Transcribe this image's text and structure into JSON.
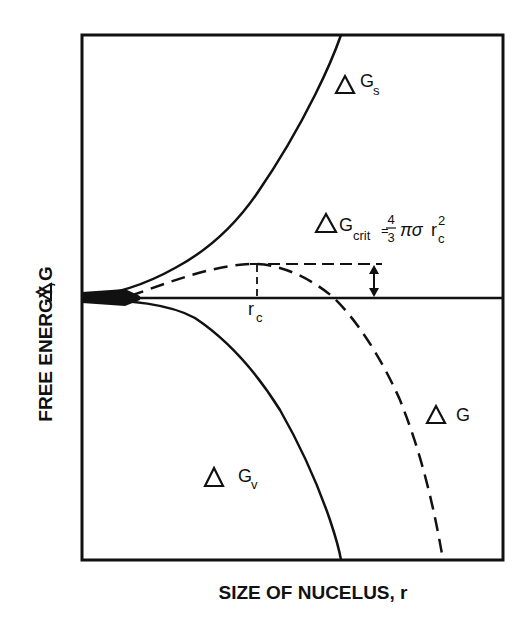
{
  "figure": {
    "y_axis_label": "FREE ENERGY, ",
    "y_axis_symbol": "G",
    "x_axis_label": "SIZE OF NUCELUS, r",
    "curves": {
      "surface": {
        "symbol": "G",
        "subscript": "s",
        "style": "solid"
      },
      "volume": {
        "symbol": "G",
        "subscript": "v",
        "style": "solid"
      },
      "total": {
        "symbol": "G",
        "subscript": "",
        "style": "dashed"
      }
    },
    "critical_radius_label": {
      "main": "r",
      "subscript": "c"
    },
    "formula": {
      "lhs_symbol": "G",
      "lhs_subscript": "crit",
      "equals": "=",
      "frac_num": "4",
      "frac_den": "3",
      "pi_sigma": "πσ",
      "r": "r",
      "r_sub": "c",
      "r_sup": "2"
    },
    "colors": {
      "ink": "#111111",
      "background": "#ffffff"
    }
  }
}
